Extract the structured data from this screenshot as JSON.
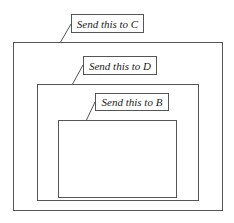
{
  "diagram": {
    "boxes": [
      {
        "id": "C",
        "label": "Send this to C"
      },
      {
        "id": "D",
        "label": "Send this to D"
      },
      {
        "id": "B",
        "label": "Send this to B"
      }
    ]
  }
}
